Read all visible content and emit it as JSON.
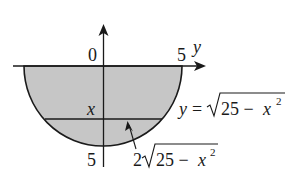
{
  "diagram": {
    "type": "semicircular-region-with-strip",
    "colors": {
      "fill": "#c6c6c6",
      "stroke": "#1a1a1a",
      "background": "#ffffff"
    },
    "axes": {
      "horizontal_axis_label": "y",
      "vertical_axis_direction": "up",
      "origin_label": "0",
      "horizontal_tick_label": "5",
      "vertical_tick_label": "5"
    },
    "labels": {
      "strip_depth": "x",
      "curve_equation_lhs": "y = ",
      "curve_sqrt_body": "25 − x",
      "curve_sqrt_exp": "2",
      "width_coeff": "2",
      "width_sqrt_body": "25 − x",
      "width_sqrt_exp": "2"
    },
    "annotations": [
      {
        "text": "y = √(25 − x²)",
        "points_to": "semicircle boundary"
      },
      {
        "text": "2√(25 − x²)",
        "points_to": "horizontal strip at depth x"
      }
    ]
  }
}
